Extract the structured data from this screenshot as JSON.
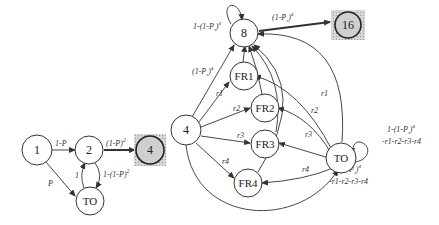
{
  "diagram": {
    "left": {
      "nodes": [
        {
          "id": "1",
          "label": "1"
        },
        {
          "id": "2",
          "label": "2"
        },
        {
          "id": "4",
          "label": "4",
          "terminal": true
        },
        {
          "id": "TO",
          "label": "TO"
        }
      ],
      "edges": [
        {
          "from": "1",
          "to": "2",
          "label": "1-P"
        },
        {
          "from": "1",
          "to": "TO",
          "label": "P"
        },
        {
          "from": "2",
          "to": "4",
          "label": "(1-P)",
          "sup": "2"
        },
        {
          "from": "2",
          "to": "TO",
          "label": "1-(1-P)",
          "sup": "2"
        },
        {
          "from": "TO",
          "to": "2",
          "label": "1"
        }
      ]
    },
    "right": {
      "nodes": [
        {
          "id": "4",
          "label": "4"
        },
        {
          "id": "8",
          "label": "8"
        },
        {
          "id": "16",
          "label": "16",
          "terminal": true
        },
        {
          "id": "FR1",
          "label": "FR1"
        },
        {
          "id": "FR2",
          "label": "FR2"
        },
        {
          "id": "FR3",
          "label": "FR3"
        },
        {
          "id": "FR4",
          "label": "FR4"
        },
        {
          "id": "TO",
          "label": "TO"
        }
      ],
      "edges": [
        {
          "from": "8",
          "to": "8",
          "label": "1-(1-P",
          "sub": "s",
          "close": ")",
          "sup": "4"
        },
        {
          "from": "8",
          "to": "16",
          "label": "(1-P",
          "sub": "s",
          "close": ")",
          "sup": "4"
        },
        {
          "from": "4",
          "to": "8",
          "label": "(1-P",
          "sub": "s",
          "close": ")",
          "sup": "4"
        },
        {
          "from": "4",
          "to": "FR1",
          "label": "r1"
        },
        {
          "from": "4",
          "to": "FR2",
          "label": "r2"
        },
        {
          "from": "4",
          "to": "FR3",
          "label": "r3"
        },
        {
          "from": "4",
          "to": "FR4",
          "label": "r4"
        },
        {
          "from": "TO",
          "to": "FR1",
          "label": "r1"
        },
        {
          "from": "TO",
          "to": "FR2",
          "label": "r2"
        },
        {
          "from": "TO",
          "to": "FR3",
          "label": "r3"
        },
        {
          "from": "TO",
          "to": "FR4",
          "label": "r4"
        },
        {
          "from": "TO",
          "to": "TO",
          "label": "1-(1-P",
          "sub": "s",
          "close": ")",
          "sup": "4",
          "line2": "-r1-r2-r3-r4"
        },
        {
          "from": "4",
          "to": "TO",
          "label": "1-(1-P",
          "sub": "s",
          "close": ")",
          "sup": "4",
          "line2": "-r1-r2-r3-r4"
        },
        {
          "from": "FR1",
          "to": "8"
        },
        {
          "from": "FR2",
          "to": "8"
        },
        {
          "from": "FR3",
          "to": "8"
        },
        {
          "from": "FR4",
          "to": "8"
        },
        {
          "from": "TO",
          "to": "8"
        }
      ]
    }
  }
}
